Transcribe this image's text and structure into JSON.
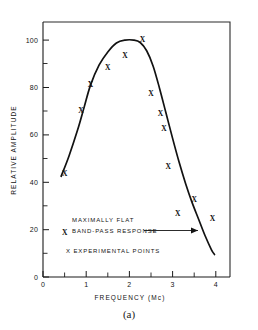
{
  "figure": {
    "caption": "(a)"
  },
  "chart_data": {
    "type": "line",
    "title": "",
    "xlabel": "FREQUENCY (Mc)",
    "ylabel": "RELATIVE AMPLITUDE",
    "xlim": [
      0,
      4.4
    ],
    "ylim": [
      0,
      108
    ],
    "grid": false,
    "x_ticks": [
      0,
      1,
      2,
      3,
      4
    ],
    "x_tick_labels": [
      "0",
      "1",
      "2",
      "3",
      "4"
    ],
    "x_minor_ticks": [
      0.5,
      1.5,
      2.5,
      3.5
    ],
    "y_ticks": [
      0,
      20,
      40,
      60,
      80,
      100
    ],
    "y_tick_labels": [
      "0",
      "20",
      "40",
      "60",
      "80",
      "100"
    ],
    "y_minor_ticks": [
      10,
      30,
      50,
      70,
      90
    ],
    "series": [
      {
        "name": "MAXIMALLY FLAT BAND-PASS RESPONSE",
        "type": "line",
        "points": [
          [
            0.42,
            42.5
          ],
          [
            0.6,
            51.0
          ],
          [
            0.8,
            62.0
          ],
          [
            0.95,
            71.5
          ],
          [
            1.1,
            81.0
          ],
          [
            1.3,
            89.5
          ],
          [
            1.5,
            95.0
          ],
          [
            1.7,
            98.8
          ],
          [
            1.9,
            100.0
          ],
          [
            2.1,
            100.0
          ],
          [
            2.25,
            99.0
          ],
          [
            2.4,
            95.5
          ],
          [
            2.55,
            89.0
          ],
          [
            2.7,
            79.5
          ],
          [
            2.85,
            69.0
          ],
          [
            3.0,
            58.5
          ],
          [
            3.15,
            48.5
          ],
          [
            3.3,
            39.5
          ],
          [
            3.45,
            31.5
          ],
          [
            3.6,
            24.5
          ],
          [
            3.75,
            17.5
          ],
          [
            3.9,
            11.5
          ],
          [
            3.97,
            9.5
          ]
        ]
      },
      {
        "name": "X EXPERIMENTAL POINTS",
        "type": "scatter",
        "marker": "x",
        "points": [
          [
            0.5,
            43.5
          ],
          [
            0.5,
            18.5
          ],
          [
            0.88,
            70.0
          ],
          [
            1.1,
            81.0
          ],
          [
            1.5,
            88.0
          ],
          [
            1.9,
            93.0
          ],
          [
            2.3,
            100.0
          ],
          [
            2.5,
            77.0
          ],
          [
            2.72,
            68.5
          ],
          [
            2.8,
            62.5
          ],
          [
            2.9,
            46.5
          ],
          [
            3.12,
            26.5
          ],
          [
            3.5,
            32.5
          ],
          [
            3.92,
            24.5
          ]
        ]
      }
    ],
    "annotations": [
      {
        "name": "curve-label",
        "line1": "MAXIMALLY FLAT",
        "line2": "BAND-PASS RESPONSE",
        "arrow": true,
        "arrow_from": [
          2.35,
          18.5
        ],
        "arrow_to": [
          3.63,
          18.5
        ]
      },
      {
        "name": "legend-note",
        "text": "X EXPERIMENTAL POINTS"
      }
    ],
    "colors": {
      "curve": "#121212",
      "marker": "#101010",
      "axis": "#1b1b1b",
      "background": "#ffffff"
    }
  }
}
